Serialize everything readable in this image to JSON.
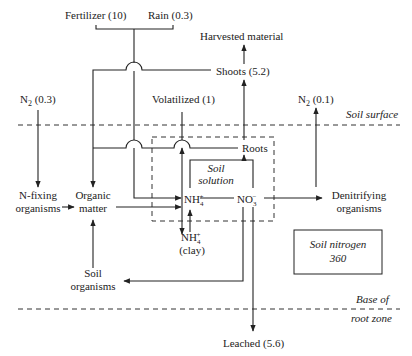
{
  "inputs": {
    "fertilizer": "Fertilizer (10)",
    "rain": "Rain (0.3)",
    "n2_in": "N",
    "n2_in_sub": "2",
    "n2_in_val": " (0.3)"
  },
  "outputs": {
    "harvested": "Harvested material",
    "shoots": "Shoots (5.2)",
    "volatilized": "Volatilized (1)",
    "n2_out": "N",
    "n2_out_sub": "2",
    "n2_out_val": " (0.1)",
    "leached": "Leached (5.6)"
  },
  "boundaries": {
    "soil_surface": "Soil surface",
    "base_of": "Base of",
    "root_zone": "root zone"
  },
  "nodes": {
    "roots": "Roots",
    "soil_solution_1": "Soil",
    "soil_solution_2": "solution",
    "n_fixing_1": "N-fixing",
    "n_fixing_2": "organisms",
    "organic_1": "Organic",
    "organic_2": "matter",
    "nh4": "NH",
    "nh4_sub": "4",
    "nh4_sup": "+",
    "no3": "NO",
    "no3_sub": "3",
    "no3_sup": "−",
    "nh4_clay": "NH",
    "nh4_clay_sub": "4",
    "nh4_clay_sup": "+",
    "clay": "(clay)",
    "denitrifying_1": "Denitrifying",
    "denitrifying_2": "organisms",
    "soil_organisms_1": "Soil",
    "soil_organisms_2": "organisms"
  },
  "pool": {
    "label": "Soil nitrogen",
    "value": "360"
  }
}
